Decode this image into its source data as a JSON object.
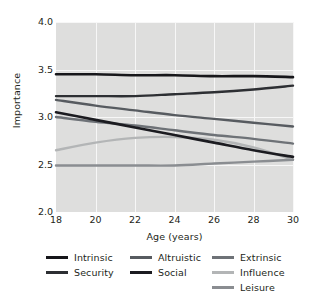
{
  "chart_data": {
    "type": "line",
    "title": "",
    "xlabel": "Age (years)",
    "ylabel": "Importance",
    "xlim": [
      18,
      30
    ],
    "ylim": [
      2.0,
      4.0
    ],
    "xticks": [
      "18",
      "20",
      "22",
      "24",
      "26",
      "28",
      "30"
    ],
    "xtick_values": [
      18,
      20,
      22,
      24,
      26,
      28,
      30
    ],
    "yticks": [
      "2.0",
      "2.5",
      "3.0",
      "3.5",
      "4.0"
    ],
    "ytick_values": [
      2.0,
      2.5,
      3.0,
      3.5,
      4.0
    ],
    "grid": true,
    "legend_position": "bottom",
    "x": [
      18,
      20,
      22,
      24,
      26,
      28,
      30
    ],
    "series": [
      {
        "name": "Intrinsic",
        "color": "#16161a",
        "width": 2.6,
        "values": [
          3.45,
          3.45,
          3.44,
          3.44,
          3.43,
          3.43,
          3.42
        ]
      },
      {
        "name": "Security",
        "color": "#2d2f33",
        "width": 2.4,
        "values": [
          3.22,
          3.22,
          3.22,
          3.24,
          3.26,
          3.29,
          3.33
        ]
      },
      {
        "name": "Altruistic",
        "color": "#575b60",
        "width": 2.4,
        "values": [
          3.18,
          3.12,
          3.07,
          3.02,
          2.98,
          2.94,
          2.9
        ]
      },
      {
        "name": "Social",
        "color": "#1b1b20",
        "width": 2.6,
        "values": [
          3.05,
          2.97,
          2.89,
          2.81,
          2.73,
          2.65,
          2.58
        ]
      },
      {
        "name": "Extrinsic",
        "color": "#6e7277",
        "width": 2.4,
        "values": [
          3.0,
          2.95,
          2.91,
          2.86,
          2.81,
          2.77,
          2.72
        ]
      },
      {
        "name": "Influence",
        "color": "#b3b5b6",
        "width": 2.4,
        "values": [
          2.65,
          2.73,
          2.78,
          2.79,
          2.76,
          2.68,
          2.55
        ]
      },
      {
        "name": "Leisure",
        "color": "#8a8d91",
        "width": 2.4,
        "values": [
          2.49,
          2.49,
          2.49,
          2.49,
          2.51,
          2.53,
          2.55
        ]
      }
    ],
    "legend_columns": [
      [
        "Intrinsic",
        "Security"
      ],
      [
        "Altruistic",
        "Social"
      ],
      [
        "Extrinsic",
        "Influence",
        "Leisure"
      ]
    ],
    "panel_background": "#dededd",
    "gridline_color": "#f7f7f7"
  }
}
